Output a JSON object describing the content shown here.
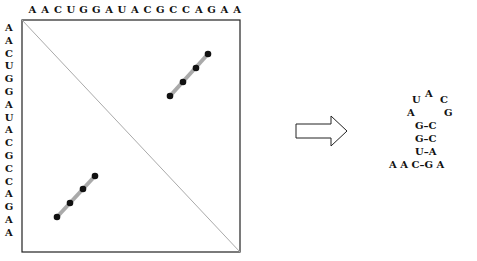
{
  "sequence": [
    "A",
    "A",
    "C",
    "U",
    "G",
    "G",
    "A",
    "U",
    "A",
    "C",
    "G",
    "C",
    "C",
    "A",
    "G",
    "A",
    "A"
  ],
  "dotplot": {
    "upper_diagonal_dots": [
      [
        12,
        7
      ],
      [
        13,
        6
      ],
      [
        14,
        5
      ],
      [
        15,
        4
      ]
    ],
    "lower_diagonal_dots": [
      [
        4,
        15
      ],
      [
        5,
        14
      ],
      [
        6,
        13
      ],
      [
        7,
        12
      ]
    ]
  },
  "arrow": "right-arrow",
  "structure": {
    "loop_top": "A",
    "row1_left": "U",
    "row1_right": "C",
    "row2_left": "A",
    "row2_right": "G",
    "pairs": [
      "G–C",
      "G–C",
      "U–A"
    ],
    "bottom": "A A C–G A"
  }
}
